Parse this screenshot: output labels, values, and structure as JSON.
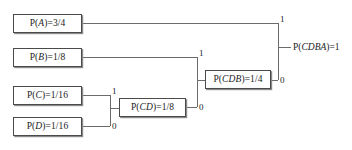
{
  "diagram": {
    "line_color": "#6b6b6b",
    "box_border_color": "#4a4a4a",
    "text_color": "#1b1b1b",
    "background": "#ffffff",
    "nodes": [
      {
        "id": "A",
        "label": "P(A)=3/4",
        "sym": "P(",
        "var": "A",
        "tail": ")=3/4"
      },
      {
        "id": "B",
        "label": "P(B)=1/8",
        "sym": "P(",
        "var": "B",
        "tail": ")=1/8"
      },
      {
        "id": "C",
        "label": "P(C)=1/16",
        "sym": "P(",
        "var": "C",
        "tail": ")=1/16"
      },
      {
        "id": "D",
        "label": "P(D)=1/16",
        "sym": "P(",
        "var": "D",
        "tail": ")=1/16"
      },
      {
        "id": "CD",
        "label": "P(CD)=1/8",
        "sym": "P(",
        "var": "CD",
        "tail": ")=1/8"
      },
      {
        "id": "CDB",
        "label": "P(CDB)=1/4",
        "sym": "P(",
        "var": "CDB",
        "tail": ")=1/4"
      }
    ],
    "root": {
      "id": "CDBA",
      "label": "P(CDBA)=1",
      "sym": "P(",
      "var": "CDBA",
      "tail": ")=1"
    },
    "edge_labels": [
      {
        "id": "cd-one",
        "value": "1",
        "for": "C to CD merge"
      },
      {
        "id": "cd-zero",
        "value": "0",
        "for": "D to CD merge"
      },
      {
        "id": "cdb-one",
        "value": "1",
        "for": "B to CDB merge"
      },
      {
        "id": "cdb-zero",
        "value": "0",
        "for": "CD to CDB merge"
      },
      {
        "id": "root-one",
        "value": "1",
        "for": "A to CDBA merge"
      },
      {
        "id": "root-zero",
        "value": "0",
        "for": "CDB to CDBA merge"
      }
    ]
  }
}
